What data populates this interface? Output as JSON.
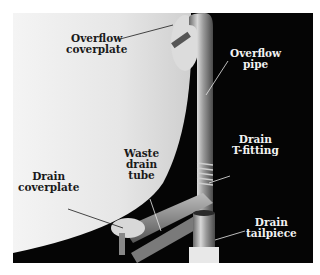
{
  "figure": {
    "background_colors": {
      "tub": "#e9e9e9",
      "backdrop": "#050505",
      "page": "#ffffff"
    },
    "labels": [
      {
        "id": "overflow-coverplate",
        "lines": [
          "Overflow",
          "coverplate"
        ]
      },
      {
        "id": "overflow-pipe",
        "lines": [
          "Overflow",
          "pipe"
        ]
      },
      {
        "id": "drain-t-fitting",
        "lines": [
          "Drain",
          "T-fitting"
        ]
      },
      {
        "id": "waste-drain-tube",
        "lines": [
          "Waste",
          "drain",
          "tube"
        ]
      },
      {
        "id": "drain-coverplate",
        "lines": [
          "Drain",
          "coverplate"
        ]
      },
      {
        "id": "drain-tailpiece",
        "lines": [
          "Drain",
          "tailpiece"
        ]
      }
    ]
  }
}
